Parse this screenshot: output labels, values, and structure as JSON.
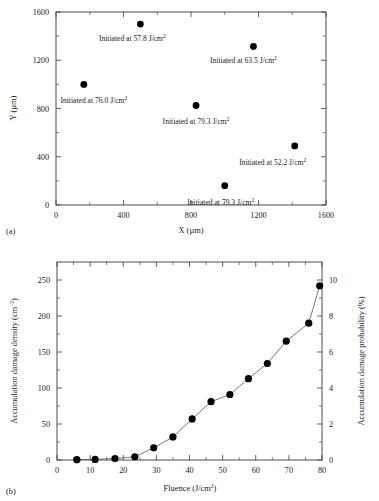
{
  "figure": {
    "panel_a_label": "(a)",
    "panel_b_label": "(b)"
  },
  "chart_data": [
    {
      "type": "scatter",
      "panel": "(a)",
      "title": "",
      "xlabel": "X (µm)",
      "ylabel": "Y (µm)",
      "xlim": [
        0,
        1600
      ],
      "ylim": [
        0,
        1600
      ],
      "xticks": [
        0,
        400,
        800,
        1200,
        1600
      ],
      "yticks": [
        0,
        400,
        800,
        1200,
        1600
      ],
      "xtick_labels": [
        "0",
        "400",
        "800",
        "1200",
        "1600"
      ],
      "ytick_labels": [
        "0",
        "400",
        "800",
        "1200",
        "1600"
      ],
      "minor_tick_step": 200,
      "grid": false,
      "legend": "none",
      "marker": "filled-circle",
      "points": [
        {
          "x": 500,
          "y": 1500,
          "fluence": 57.8,
          "label": "Initiated at 57.8 J/cm",
          "label_sup": "2"
        },
        {
          "x": 1170,
          "y": 1315,
          "fluence": 63.5,
          "label": "Initiated at 63.5 J/cm",
          "label_sup": "2"
        },
        {
          "x": 165,
          "y": 1000,
          "fluence": 76.0,
          "label": "Initiated at 76.0 J/cm",
          "label_sup": "2"
        },
        {
          "x": 830,
          "y": 825,
          "fluence": 79.3,
          "label": "Initiated at 79.3 J/cm",
          "label_sup": "2"
        },
        {
          "x": 1415,
          "y": 490,
          "fluence": 52.2,
          "label": "Initiated at 52.2 J/cm",
          "label_sup": "2"
        },
        {
          "x": 1000,
          "y": 160,
          "fluence": 79.3,
          "label": "Initiated at 79.3 J/cm",
          "label_sup": "2"
        }
      ]
    },
    {
      "type": "line",
      "panel": "(b)",
      "title": "",
      "xlabel": "Fluence (J/cm",
      "xlabel_sup": "2",
      "xlabel_tail": ")",
      "ylabel": "Accumulation damage density (cm",
      "ylabel_sup": "−2",
      "ylabel_tail": ")",
      "ylabel_right": "Accumulation damage probability (%)",
      "xlim": [
        0,
        80
      ],
      "ylim": [
        0,
        275
      ],
      "ylim_right": [
        0,
        11
      ],
      "xticks": [
        0,
        10,
        20,
        30,
        40,
        50,
        60,
        70,
        80
      ],
      "yticks": [
        0,
        50,
        100,
        150,
        200,
        250
      ],
      "yticks_right": [
        0,
        2,
        4,
        6,
        8,
        10
      ],
      "xtick_labels": [
        "0",
        "10",
        "20",
        "30",
        "40",
        "50",
        "60",
        "70",
        "80"
      ],
      "ytick_labels": [
        "0",
        "50",
        "100",
        "150",
        "200",
        "250"
      ],
      "ytick_right_labels": [
        "0",
        "2",
        "4",
        "6",
        "8",
        "10"
      ],
      "x_minor_step": 5,
      "y_minor_step": 25,
      "y_right_minor_step": 1,
      "grid": false,
      "legend": "none",
      "marker": "filled-circle",
      "x": [
        6.0,
        11.5,
        17.5,
        23.5,
        29.2,
        35.0,
        40.8,
        46.5,
        52.2,
        57.8,
        63.5,
        69.2,
        76.0,
        79.3
      ],
      "values": [
        0.5,
        0.8,
        2.0,
        4.5,
        17.0,
        32.0,
        57.0,
        81.0,
        91.0,
        113.0,
        134.0,
        165.0,
        190.0,
        242.0
      ],
      "values_right_percent": [
        0.02,
        0.03,
        0.08,
        0.18,
        0.68,
        1.28,
        2.28,
        3.24,
        3.64,
        4.52,
        5.36,
        6.6,
        7.6,
        9.68
      ]
    }
  ]
}
